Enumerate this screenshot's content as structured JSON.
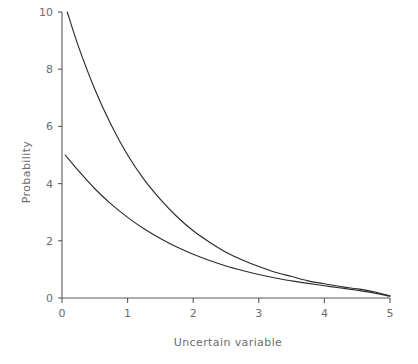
{
  "chart_data": {
    "type": "line",
    "title": "",
    "xlabel": "Uncertain variable",
    "ylabel": "Probability",
    "xlim": [
      0,
      5
    ],
    "ylim": [
      0,
      10
    ],
    "xticks": [
      0,
      1,
      2,
      3,
      4,
      5
    ],
    "xtick_labels": [
      "0",
      "1",
      "2",
      "3",
      "4",
      "5"
    ],
    "yticks": [
      0,
      2,
      4,
      6,
      8,
      10
    ],
    "ytick_labels": [
      "0",
      "2",
      "4",
      "6",
      "8",
      "10"
    ],
    "grid": false,
    "legend": "none",
    "series": [
      {
        "name": "upper-decay-curve",
        "description": "exponential decay starting near 10 at x=0.08 falling to 0 at x=5",
        "color": "#2b2b2b",
        "x": [
          0.08,
          0.25,
          0.5,
          0.75,
          1.0,
          1.25,
          1.5,
          1.75,
          2.0,
          2.25,
          2.5,
          2.75,
          3.0,
          3.25,
          3.5,
          3.75,
          4.0,
          4.25,
          4.5,
          4.75,
          5.0
        ],
        "y": [
          10.0,
          8.8,
          7.3,
          6.05,
          5.0,
          4.15,
          3.45,
          2.85,
          2.35,
          1.95,
          1.6,
          1.33,
          1.1,
          0.9,
          0.75,
          0.6,
          0.5,
          0.4,
          0.32,
          0.22,
          0.08
        ]
      },
      {
        "name": "lower-decay-curve",
        "description": "exponential decay starting near 5 at x=0.05 falling to 0 at x=5",
        "color": "#2b2b2b",
        "x": [
          0.05,
          0.25,
          0.5,
          0.75,
          1.0,
          1.25,
          1.5,
          1.75,
          2.0,
          2.25,
          2.5,
          2.75,
          3.0,
          3.25,
          3.5,
          3.75,
          4.0,
          4.25,
          4.5,
          4.75,
          5.0
        ],
        "y": [
          5.0,
          4.45,
          3.82,
          3.28,
          2.82,
          2.42,
          2.08,
          1.78,
          1.53,
          1.31,
          1.12,
          0.96,
          0.82,
          0.7,
          0.6,
          0.51,
          0.43,
          0.35,
          0.27,
          0.18,
          0.06
        ]
      }
    ]
  }
}
